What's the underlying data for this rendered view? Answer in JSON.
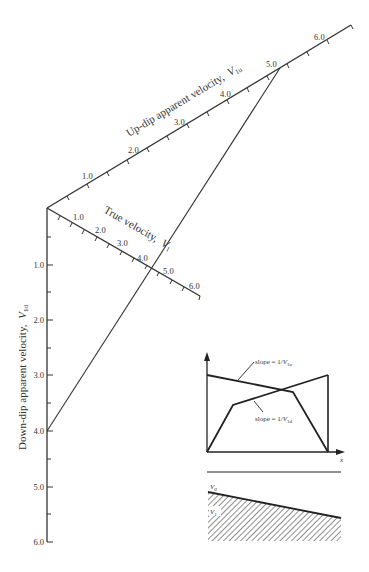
{
  "diagram": {
    "updip_axis": {
      "title": "Up-dip apparent velocity,",
      "symbol": "V",
      "subscript": "1u",
      "ticks": [
        "1.0",
        "2.0",
        "3.0",
        "4.0",
        "5.0",
        "6.0"
      ]
    },
    "true_axis": {
      "title": "True velocity,",
      "symbol": "V",
      "subscript": "1",
      "ticks": [
        "1.0",
        "2.0",
        "3.0",
        "4.0",
        "5.0",
        "6.0"
      ]
    },
    "downdip_axis": {
      "title": "Down-dip apparent velocity,",
      "symbol": "V",
      "subscript": "1d",
      "ticks": [
        "1.0",
        "2.0",
        "3.0",
        "4.0",
        "5.0",
        "6.0"
      ]
    },
    "construction_line": {
      "from": "V1d = 4.0",
      "to": "V1u = 5.0",
      "crosses_true_axis_at": "≈4.4"
    },
    "inset": {
      "slope_up_label": "slope = 1/",
      "slope_up_symbol": "V",
      "slope_up_sub": "1u",
      "slope_down_label": "slope = 1/",
      "slope_down_symbol": "V",
      "slope_down_sub": "1d",
      "x_axis_label": "x",
      "layer_top_label": "V",
      "layer_top_sub": "0",
      "layer_bottom_label": "V",
      "layer_bottom_sub": "1"
    }
  }
}
